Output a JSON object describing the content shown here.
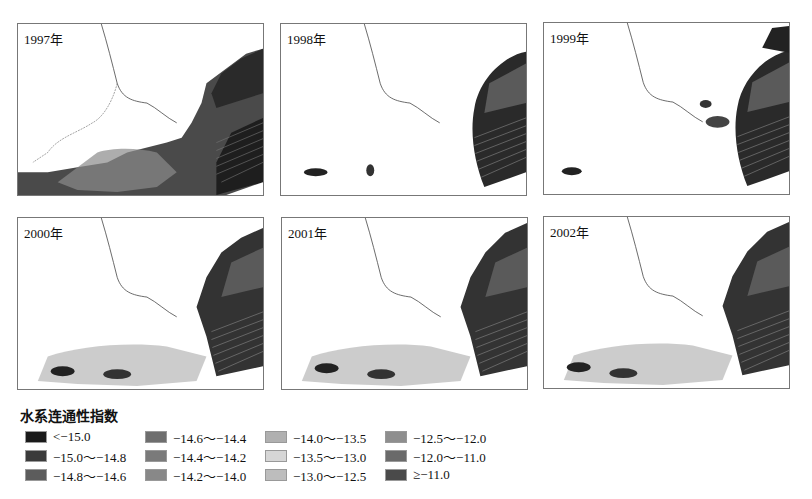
{
  "panels": [
    {
      "id": "p1997",
      "label": "1997年"
    },
    {
      "id": "p1998",
      "label": "1998年"
    },
    {
      "id": "p1999",
      "label": "1999年"
    },
    {
      "id": "p2000",
      "label": "2000年"
    },
    {
      "id": "p2001",
      "label": "2001年"
    },
    {
      "id": "p2002",
      "label": "2002年"
    }
  ],
  "legend": {
    "title": "水系连通性指数",
    "items": [
      {
        "label": "<−15.0",
        "color": "#1a1a1a"
      },
      {
        "label": "−15.0～−14.8",
        "color": "#3a3a3a"
      },
      {
        "label": "−14.8～−14.6",
        "color": "#5c5c5c"
      },
      {
        "label": "−14.6～−14.4",
        "color": "#6e6e6e"
      },
      {
        "label": "−14.4～−14.2",
        "color": "#7a7a7a"
      },
      {
        "label": "−14.2～−14.0",
        "color": "#888888"
      },
      {
        "label": "−14.0～−13.5",
        "color": "#b0b0b0"
      },
      {
        "label": "−13.5～−13.0",
        "color": "#d6d6d6"
      },
      {
        "label": "−13.0～−12.5",
        "color": "#bdbdbd"
      },
      {
        "label": "−12.5～−12.0",
        "color": "#8e8e8e"
      },
      {
        "label": "−12.0～−11.0",
        "color": "#6a6a6a"
      },
      {
        "label": "≥−11.0",
        "color": "#4a4a4a"
      }
    ]
  }
}
